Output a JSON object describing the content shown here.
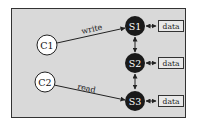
{
  "diagram": {
    "frame": {
      "fill": "#d9d9d9",
      "stroke": "#333333"
    },
    "clients": [
      {
        "id": "C1",
        "label": "C1"
      },
      {
        "id": "C2",
        "label": "C2"
      }
    ],
    "servers": [
      {
        "id": "S1",
        "label": "S1"
      },
      {
        "id": "S2",
        "label": "S2"
      },
      {
        "id": "S3",
        "label": "S3"
      }
    ],
    "data_boxes": [
      {
        "label": "data"
      },
      {
        "label": "data"
      },
      {
        "label": "data"
      }
    ],
    "edges": [
      {
        "from": "C1",
        "to": "S1",
        "label": "write"
      },
      {
        "from": "C2",
        "to": "S3",
        "label": "read"
      },
      {
        "from": "S1",
        "to": "S2",
        "label": ""
      },
      {
        "from": "S2",
        "to": "S3",
        "label": ""
      }
    ],
    "colors": {
      "server_fill": "#1a1a1a",
      "server_text": "#ffffff",
      "client_fill": "#ffffff",
      "line": "#222222"
    }
  }
}
